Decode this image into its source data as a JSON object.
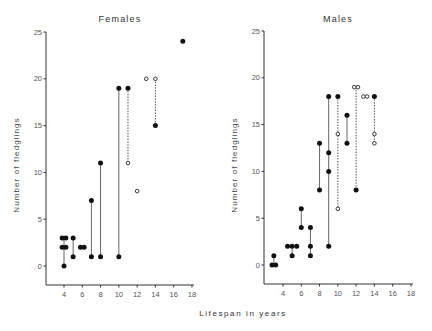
{
  "chart_data": [
    {
      "type": "scatter",
      "title": "Females",
      "xlabel": "Lifespan in years",
      "ylabel": "Number of fledglings",
      "xlim": [
        2,
        18
      ],
      "ylim": [
        -2,
        25
      ],
      "xticks": [
        4,
        6,
        8,
        10,
        12,
        14,
        16,
        18
      ],
      "yticks": [
        0,
        5,
        10,
        15,
        20,
        25
      ],
      "grid": false,
      "legend": null,
      "points": [
        {
          "x": 3.8,
          "y": 3,
          "marker": "filled"
        },
        {
          "x": 4.2,
          "y": 3,
          "marker": "filled"
        },
        {
          "x": 3.8,
          "y": 2,
          "marker": "filled"
        },
        {
          "x": 4.2,
          "y": 2,
          "marker": "filled"
        },
        {
          "x": 4.0,
          "y": 0,
          "marker": "filled"
        },
        {
          "x": 5,
          "y": 3,
          "marker": "filled"
        },
        {
          "x": 5,
          "y": 1,
          "marker": "filled"
        },
        {
          "x": 5.8,
          "y": 2,
          "marker": "filled"
        },
        {
          "x": 6.2,
          "y": 2,
          "marker": "filled"
        },
        {
          "x": 7,
          "y": 7,
          "marker": "filled"
        },
        {
          "x": 7,
          "y": 1,
          "marker": "filled"
        },
        {
          "x": 8,
          "y": 11,
          "marker": "filled"
        },
        {
          "x": 8,
          "y": 1,
          "marker": "filled"
        },
        {
          "x": 10,
          "y": 19,
          "marker": "filled"
        },
        {
          "x": 10,
          "y": 1,
          "marker": "filled"
        },
        {
          "x": 11,
          "y": 19,
          "marker": "filled"
        },
        {
          "x": 11,
          "y": 11,
          "marker": "open"
        },
        {
          "x": 12,
          "y": 8,
          "marker": "open"
        },
        {
          "x": 13,
          "y": 20,
          "marker": "open"
        },
        {
          "x": 14,
          "y": 20,
          "marker": "open"
        },
        {
          "x": 14,
          "y": 15,
          "marker": "filled"
        },
        {
          "x": 17,
          "y": 24,
          "marker": "filled"
        }
      ],
      "segments": [
        {
          "x": 4,
          "y1": 3,
          "y2": 0,
          "style": "solid"
        },
        {
          "x": 5,
          "y1": 3,
          "y2": 1,
          "style": "solid"
        },
        {
          "x": 7,
          "y1": 7,
          "y2": 1,
          "style": "solid"
        },
        {
          "x": 8,
          "y1": 11,
          "y2": 1,
          "style": "solid"
        },
        {
          "x": 10,
          "y1": 19,
          "y2": 1,
          "style": "solid"
        },
        {
          "x": 11,
          "y1": 19,
          "y2": 11,
          "style": "dashed"
        },
        {
          "x": 14,
          "y1": 20,
          "y2": 15,
          "style": "dashed"
        }
      ]
    },
    {
      "type": "scatter",
      "title": "Males",
      "xlabel": "Lifespan in years",
      "ylabel": "Number of fledglings",
      "xlim": [
        2,
        18
      ],
      "ylim": [
        -2,
        25
      ],
      "xticks": [
        4,
        6,
        8,
        10,
        12,
        14,
        16,
        18
      ],
      "yticks": [
        0,
        5,
        10,
        15,
        20,
        25
      ],
      "grid": false,
      "legend": null,
      "points": [
        {
          "x": 2.8,
          "y": 0,
          "marker": "filled"
        },
        {
          "x": 3.2,
          "y": 0,
          "marker": "filled"
        },
        {
          "x": 3.0,
          "y": 1,
          "marker": "filled"
        },
        {
          "x": 4.5,
          "y": 2,
          "marker": "filled"
        },
        {
          "x": 5.0,
          "y": 2,
          "marker": "filled"
        },
        {
          "x": 5.5,
          "y": 2,
          "marker": "filled"
        },
        {
          "x": 5.0,
          "y": 1,
          "marker": "filled"
        },
        {
          "x": 6,
          "y": 6,
          "marker": "filled"
        },
        {
          "x": 6,
          "y": 4,
          "marker": "filled"
        },
        {
          "x": 7,
          "y": 4,
          "marker": "filled"
        },
        {
          "x": 7,
          "y": 2,
          "marker": "filled"
        },
        {
          "x": 7,
          "y": 1,
          "marker": "filled"
        },
        {
          "x": 8,
          "y": 13,
          "marker": "filled"
        },
        {
          "x": 8,
          "y": 8,
          "marker": "filled"
        },
        {
          "x": 9,
          "y": 18,
          "marker": "filled"
        },
        {
          "x": 9,
          "y": 12,
          "marker": "filled"
        },
        {
          "x": 9,
          "y": 10,
          "marker": "filled"
        },
        {
          "x": 9,
          "y": 2,
          "marker": "filled"
        },
        {
          "x": 10,
          "y": 18,
          "marker": "filled"
        },
        {
          "x": 10,
          "y": 14,
          "marker": "open"
        },
        {
          "x": 10,
          "y": 6,
          "marker": "open"
        },
        {
          "x": 11,
          "y": 16,
          "marker": "filled"
        },
        {
          "x": 11,
          "y": 13,
          "marker": "filled"
        },
        {
          "x": 11.8,
          "y": 19,
          "marker": "open"
        },
        {
          "x": 12.2,
          "y": 19,
          "marker": "open"
        },
        {
          "x": 12,
          "y": 8,
          "marker": "filled"
        },
        {
          "x": 12.8,
          "y": 18,
          "marker": "open"
        },
        {
          "x": 13.2,
          "y": 18,
          "marker": "open"
        },
        {
          "x": 14,
          "y": 18,
          "marker": "filled"
        },
        {
          "x": 14,
          "y": 14,
          "marker": "open"
        },
        {
          "x": 14,
          "y": 13,
          "marker": "open"
        }
      ],
      "segments": [
        {
          "x": 3,
          "y1": 1,
          "y2": 0,
          "style": "solid"
        },
        {
          "x": 5,
          "y1": 2,
          "y2": 1,
          "style": "solid"
        },
        {
          "x": 6,
          "y1": 6,
          "y2": 4,
          "style": "solid"
        },
        {
          "x": 7,
          "y1": 4,
          "y2": 1,
          "style": "solid"
        },
        {
          "x": 8,
          "y1": 13,
          "y2": 8,
          "style": "solid"
        },
        {
          "x": 9,
          "y1": 18,
          "y2": 2,
          "style": "solid"
        },
        {
          "x": 10,
          "y1": 18,
          "y2": 6,
          "style": "dashed"
        },
        {
          "x": 11,
          "y1": 16,
          "y2": 13,
          "style": "solid"
        },
        {
          "x": 12,
          "y1": 19,
          "y2": 8,
          "style": "dashed"
        },
        {
          "x": 14,
          "y1": 18,
          "y2": 13,
          "style": "dashed"
        }
      ]
    }
  ],
  "figure": {
    "shared_xlabel": "Lifespan in years",
    "panels": [
      {
        "title": "Females",
        "ylabel": "Number of fledglings"
      },
      {
        "title": "Males",
        "ylabel": "Number of fledglings"
      }
    ]
  }
}
